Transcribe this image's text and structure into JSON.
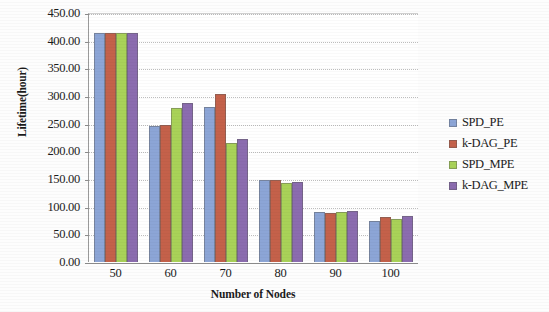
{
  "chart_data": {
    "type": "bar",
    "title": "",
    "xlabel": "Number of Nodes",
    "ylabel": "Lifetime(hour)",
    "categories": [
      "50",
      "60",
      "70",
      "80",
      "90",
      "100"
    ],
    "ylim": [
      0,
      450
    ],
    "yticks": [
      "0.00",
      "50.00",
      "100.00",
      "150.00",
      "200.00",
      "250.00",
      "300.00",
      "350.00",
      "400.00",
      "450.00"
    ],
    "ytick_values": [
      0,
      50,
      100,
      150,
      200,
      250,
      300,
      350,
      400,
      450
    ],
    "grid": true,
    "legend_position": "right",
    "series": [
      {
        "name": "SPD_PE",
        "color": "#8CA5D6",
        "values": [
          413,
          245,
          280,
          148,
          90,
          75
        ]
      },
      {
        "name": "k-DAG_PE",
        "color": "#C4614A",
        "values": [
          413,
          248,
          303,
          148,
          89,
          82
        ]
      },
      {
        "name": "SPD_MPE",
        "color": "#A9D258",
        "values": [
          413,
          278,
          215,
          143,
          91,
          78
        ]
      },
      {
        "name": "k-DAG_MPE",
        "color": "#8B6CAF",
        "values": [
          413,
          288,
          222,
          145,
          92,
          84
        ]
      }
    ]
  }
}
